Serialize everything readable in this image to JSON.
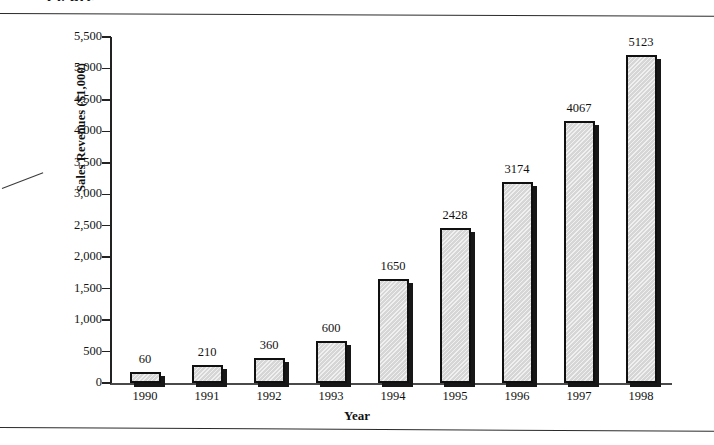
{
  "figure": {
    "title_partial": "Figure",
    "x_axis_title": "Year",
    "y_axis_title": "Sales Revenues ($1,000)"
  },
  "chart_data": {
    "type": "bar",
    "title": "",
    "xlabel": "Year",
    "ylabel": "Sales Revenues ($1,000)",
    "categories": [
      "1990",
      "1991",
      "1992",
      "1993",
      "1994",
      "1995",
      "1996",
      "1997",
      "1998"
    ],
    "values": [
      60,
      210,
      360,
      600,
      1650,
      2428,
      3174,
      4067,
      5123
    ],
    "data_labels": [
      "60",
      "210",
      "360",
      "600",
      "1650",
      "2428",
      "3174",
      "4067",
      "5123"
    ],
    "bar_pixel_values": [
      175,
      290,
      400,
      660,
      1660,
      2470,
      3200,
      4170,
      5220
    ],
    "ylim": [
      0,
      5500
    ],
    "yticks": [
      0,
      500,
      1000,
      1500,
      2000,
      2500,
      3000,
      3500,
      4000,
      4500,
      5000,
      5500
    ],
    "ytick_labels": [
      "0",
      "500",
      "1,000",
      "1,500",
      "2,000",
      "2,500",
      "3,000",
      "3,500",
      "4,000",
      "4,500",
      "5,000",
      "5,500"
    ],
    "grid": false,
    "legend": false,
    "bar_fill_color": "#dedede",
    "bar_edge_color": "#101010",
    "bar_shadow_color": "#171717"
  }
}
